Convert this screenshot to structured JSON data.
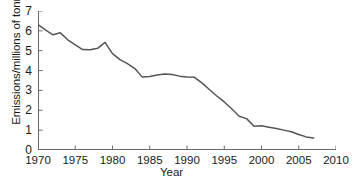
{
  "chart_data": {
    "type": "line",
    "title": "",
    "xlabel": "Year",
    "ylabel": "Emissions/millions of tonnes",
    "xlim": [
      1970,
      2010
    ],
    "ylim": [
      0,
      7
    ],
    "xticks": [
      1970,
      1975,
      1980,
      1985,
      1990,
      1995,
      2000,
      2005,
      2010
    ],
    "yticks": [
      0,
      1,
      2,
      3,
      4,
      5,
      6,
      7
    ],
    "grid": false,
    "legend": null,
    "line_color": "#555555",
    "x": [
      1970,
      1971,
      1972,
      1973,
      1974,
      1975,
      1976,
      1977,
      1978,
      1979,
      1980,
      1981,
      1982,
      1983,
      1984,
      1985,
      1986,
      1987,
      1988,
      1989,
      1990,
      1991,
      1992,
      1993,
      1994,
      1995,
      1996,
      1997,
      1998,
      1999,
      2000,
      2001,
      2002,
      2003,
      2004,
      2005,
      2006,
      2007
    ],
    "values": [
      6.32,
      6.05,
      5.8,
      5.9,
      5.55,
      5.3,
      5.06,
      5.05,
      5.12,
      5.42,
      4.85,
      4.55,
      4.35,
      4.1,
      3.67,
      3.7,
      3.78,
      3.83,
      3.8,
      3.72,
      3.68,
      3.66,
      3.38,
      3.05,
      2.72,
      2.42,
      2.08,
      1.7,
      1.58,
      1.2,
      1.22,
      1.15,
      1.08,
      1.0,
      0.92,
      0.78,
      0.66,
      0.6
    ],
    "ytick_labels": [
      "0",
      "1",
      "2",
      "3",
      "4",
      "5",
      "6",
      "7"
    ],
    "xtick_labels": [
      "1970",
      "1975",
      "1980",
      "1985",
      "1990",
      "1995",
      "2000",
      "2005",
      "2010"
    ]
  }
}
